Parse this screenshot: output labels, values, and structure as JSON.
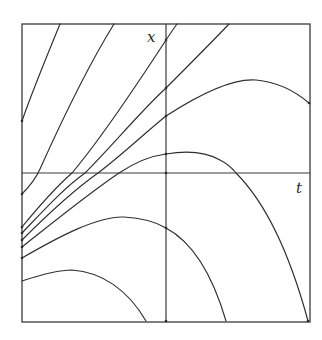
{
  "figure": {
    "type": "solution-curves-phase-diagram",
    "axis_labels": {
      "vertical": "x",
      "horizontal": "t"
    },
    "colors": {
      "line": "#2e2e2e",
      "background": "#ffffff"
    },
    "frame": {
      "x": 22,
      "y": 24,
      "width": 288,
      "height": 298
    },
    "axes": {
      "vertical_x": 166,
      "horizontal_y": 173
    },
    "curves": [
      {
        "id": "c1",
        "d": "M22 121 C 32 92, 46 58, 60 24"
      },
      {
        "id": "c2",
        "d": "M22 194 C 30 186, 36 178, 40 169 C 62 120, 88 66, 114 24"
      },
      {
        "id": "c3",
        "d": "M22 227 C 40 205, 56 187, 72 173 C 104 135, 140 80, 166 40 C 170 34, 174 28, 177 24"
      },
      {
        "id": "c4",
        "d": "M22 233 C 44 210, 64 188, 85 173 C 112 146, 140 112, 166 88 C 188 66, 210 44, 229 24"
      },
      {
        "id": "c5",
        "d": "M22 240 C 48 214, 74 190, 98 173 C 122 155, 146 132, 166 116 C 200 94, 232 78, 256 80 C 278 82, 296 92, 309 103"
      },
      {
        "id": "c6",
        "d": "M22 247 C 56 220, 88 194, 119 173 C 134 163, 150 156, 166 154 C 184 151, 204 151, 220 160 C 226 163, 232 168, 236 173 C 268 205, 292 262, 308 321"
      },
      {
        "id": "c7",
        "d": "M22 258 C 60 236, 98 216, 124 217 C 142 218, 156 222, 166 228 C 196 244, 214 280, 226 321"
      },
      {
        "id": "c8",
        "d": "M22 281 C 40 275, 58 270, 72 270 C 102 272, 128 290, 146 321"
      }
    ],
    "marked_points": [
      {
        "x": 22,
        "y": 121
      },
      {
        "x": 22,
        "y": 194
      },
      {
        "x": 22,
        "y": 227
      },
      {
        "x": 22,
        "y": 233
      },
      {
        "x": 22,
        "y": 240
      },
      {
        "x": 22,
        "y": 247
      },
      {
        "x": 22,
        "y": 258
      },
      {
        "x": 166,
        "y": 40
      },
      {
        "x": 166,
        "y": 88
      },
      {
        "x": 166,
        "y": 116
      },
      {
        "x": 166,
        "y": 154
      },
      {
        "x": 166,
        "y": 173
      },
      {
        "x": 166,
        "y": 228
      },
      {
        "x": 166,
        "y": 321
      },
      {
        "x": 309,
        "y": 103
      },
      {
        "x": 308,
        "y": 321
      }
    ]
  }
}
